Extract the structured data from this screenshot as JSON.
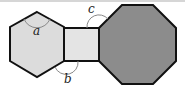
{
  "diagram": {
    "shapes": [
      {
        "name": "hexagon",
        "fill": "#dcdcdc",
        "stroke": "#111111",
        "points": "37,12 64,27 64,61 37,77 10,61 10,27"
      },
      {
        "name": "square",
        "fill": "#e4e4e4",
        "stroke": "#111111",
        "points": "64,28 99,28 99,61 64,61"
      },
      {
        "name": "octagon",
        "fill": "#8c8c8c",
        "stroke": "#111111",
        "points": "122,5 153,5 176,28 176,61 153,84 122,84 99,61 99,28"
      }
    ],
    "angles": [
      {
        "label": "a",
        "x": 33,
        "y": 35
      },
      {
        "label": "b",
        "x": 64,
        "y": 83
      },
      {
        "label": "c",
        "x": 88,
        "y": 13
      }
    ]
  }
}
